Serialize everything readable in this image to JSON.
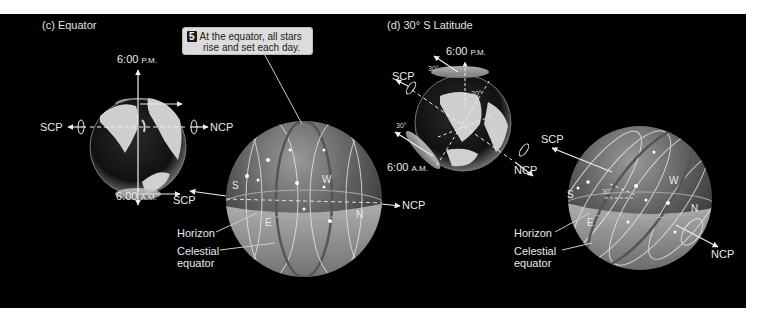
{
  "panel_c": {
    "title": "(c)  Equator",
    "earth": {
      "top_time": "6:00",
      "top_suffix": "P.M.",
      "bottom_time": "6:00",
      "bottom_suffix": "A.M.",
      "left_pole": "SCP",
      "right_pole": "NCP"
    },
    "callout": {
      "number": "5",
      "line1": "At the equator, all stars",
      "line2": "rise and set each day."
    },
    "sphere": {
      "left_pole": "SCP",
      "right_pole": "NCP",
      "dir_s": "S",
      "dir_w": "W",
      "dir_e": "E",
      "dir_n": "N",
      "horizon_label": "Horizon",
      "celestial_label_1": "Celestial",
      "celestial_label_2": "equator"
    }
  },
  "panel_d": {
    "title": "(d)  30° S Latitude",
    "earth": {
      "top_time": "6:00",
      "top_suffix": "P.M.",
      "bottom_time": "6:00",
      "bottom_suffix": "A.M.",
      "left_pole": "SCP",
      "right_pole": "NCP",
      "angle_top": "30°",
      "angle_mid": "30°",
      "angle_bottom": "30°"
    },
    "sphere": {
      "upper_pole": "SCP",
      "lower_pole": "NCP",
      "angle": "30°",
      "dir_s": "S",
      "dir_w": "W",
      "dir_e": "E",
      "dir_n": "N",
      "horizon_label": "Horizon",
      "celestial_label_1": "Celestial",
      "celestial_label_2": "equator"
    }
  },
  "colors": {
    "background": "#000000",
    "page": "#ffffff",
    "label": "#e8e8e8",
    "callout_bg": "#dcdcdc",
    "sphere_light": "#bdbdbd",
    "sphere_dark": "#4a4a4a"
  }
}
